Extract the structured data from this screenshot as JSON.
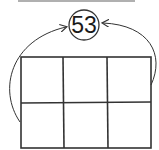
{
  "diagram": {
    "target_number": "53",
    "grid": {
      "rows": 2,
      "columns": 3,
      "cells": [
        [
          "",
          "",
          ""
        ],
        [
          "",
          "",
          ""
        ]
      ]
    },
    "arrows": [
      {
        "from": "grid-left-edge",
        "to": "circle-left"
      },
      {
        "from": "grid-right-edge",
        "to": "circle-right"
      }
    ],
    "colors": {
      "stroke": "#333333",
      "top_bar": "#b0b0b0"
    }
  }
}
